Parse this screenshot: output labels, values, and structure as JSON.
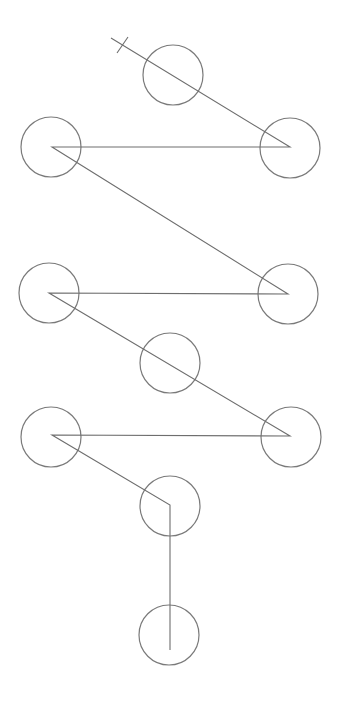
{
  "diagram": {
    "type": "node-path",
    "background": "#ffffff",
    "stroke_color": "#6e6e6e",
    "node_radius": 30,
    "nodes": [
      {
        "id": "n1",
        "cx": 173,
        "cy": 75
      },
      {
        "id": "n2",
        "cx": 51,
        "cy": 147
      },
      {
        "id": "n3",
        "cx": 290,
        "cy": 148
      },
      {
        "id": "n4",
        "cx": 49,
        "cy": 293
      },
      {
        "id": "n5",
        "cx": 288,
        "cy": 294
      },
      {
        "id": "n6",
        "cx": 170,
        "cy": 363
      },
      {
        "id": "n7",
        "cx": 51,
        "cy": 437
      },
      {
        "id": "n8",
        "cx": 291,
        "cy": 437
      },
      {
        "id": "n9",
        "cx": 170,
        "cy": 506
      },
      {
        "id": "n10",
        "cx": 169,
        "cy": 635
      }
    ],
    "path_points": [
      [
        111,
        38
      ],
      [
        290,
        147
      ],
      [
        52,
        147
      ],
      [
        288,
        294
      ],
      [
        49,
        293
      ],
      [
        290,
        436
      ],
      [
        52,
        435
      ],
      [
        170,
        505
      ],
      [
        170,
        650
      ]
    ],
    "start_tick": {
      "x1": 117,
      "y1": 53,
      "x2": 128,
      "y2": 37
    }
  }
}
